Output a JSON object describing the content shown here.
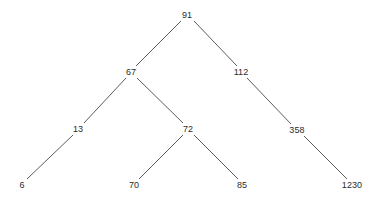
{
  "diagram": {
    "type": "binary-tree",
    "background_color": "#ffffff",
    "edge_color": "#4a4a4a",
    "text_color": "#2b2b2b",
    "nodes": [
      {
        "id": "n91",
        "label": "91",
        "x": 187,
        "y": 15,
        "level": 0
      },
      {
        "id": "n67",
        "label": "67",
        "x": 131,
        "y": 72,
        "level": 1
      },
      {
        "id": "n112",
        "label": "112",
        "x": 241,
        "y": 72,
        "level": 1
      },
      {
        "id": "n13",
        "label": "13",
        "x": 78,
        "y": 129,
        "level": 2
      },
      {
        "id": "n72",
        "label": "72",
        "x": 188,
        "y": 129,
        "level": 2
      },
      {
        "id": "n358",
        "label": "358",
        "x": 297,
        "y": 130,
        "level": 2
      },
      {
        "id": "n6",
        "label": "6",
        "x": 22,
        "y": 185,
        "level": 3
      },
      {
        "id": "n70",
        "label": "70",
        "x": 134,
        "y": 185,
        "level": 3
      },
      {
        "id": "n85",
        "label": "85",
        "x": 242,
        "y": 185,
        "level": 3
      },
      {
        "id": "n1230",
        "label": "1230",
        "x": 352,
        "y": 185,
        "level": 3
      }
    ],
    "edges": [
      {
        "from": "n91",
        "to": "n67",
        "side": "left",
        "x1": 181,
        "y1": 21,
        "x2": 136,
        "y2": 66
      },
      {
        "from": "n91",
        "to": "n112",
        "side": "right",
        "x1": 194,
        "y1": 21,
        "x2": 237,
        "y2": 66
      },
      {
        "from": "n67",
        "to": "n13",
        "side": "left",
        "x1": 126,
        "y1": 78,
        "x2": 84,
        "y2": 123
      },
      {
        "from": "n67",
        "to": "n72",
        "side": "right",
        "x1": 137,
        "y1": 78,
        "x2": 183,
        "y2": 123
      },
      {
        "from": "n112",
        "to": "n358",
        "side": "right",
        "x1": 247,
        "y1": 78,
        "x2": 291,
        "y2": 124
      },
      {
        "from": "n13",
        "to": "n6",
        "side": "left",
        "x1": 73,
        "y1": 135,
        "x2": 27,
        "y2": 179
      },
      {
        "from": "n72",
        "to": "n70",
        "side": "left",
        "x1": 183,
        "y1": 135,
        "x2": 139,
        "y2": 179
      },
      {
        "from": "n72",
        "to": "n85",
        "side": "right",
        "x1": 194,
        "y1": 135,
        "x2": 238,
        "y2": 179
      },
      {
        "from": "n358",
        "to": "n1230",
        "side": "right",
        "x1": 304,
        "y1": 136,
        "x2": 347,
        "y2": 179
      }
    ]
  }
}
